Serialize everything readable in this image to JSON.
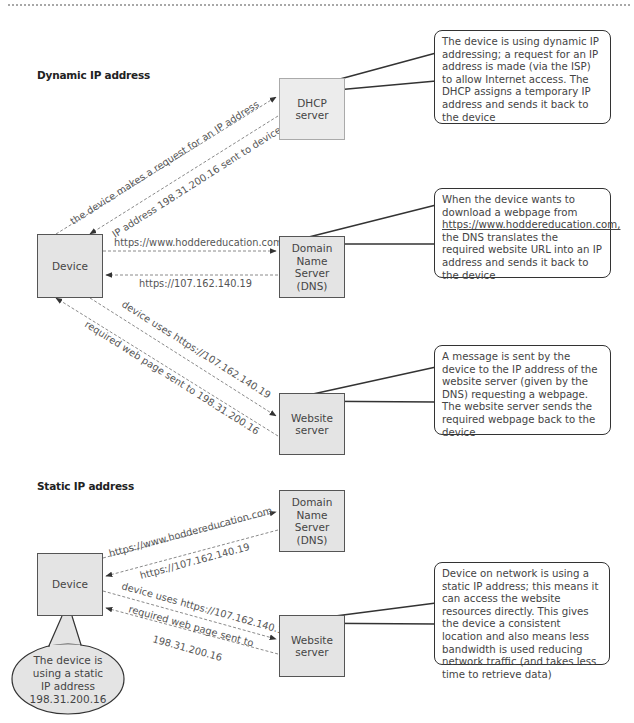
{
  "dynamic": {
    "title": "Dynamic IP address",
    "nodes": {
      "device": "Device",
      "dhcp": "DHCP\nserver",
      "dns": "Domain\nName\nServer\n(DNS)",
      "website": "Website\nserver"
    },
    "arrows": {
      "request_ip": "the device makes a request for an IP address",
      "ip_sent": "IP address 198.31.200.16 sent to device",
      "url_to_dns": "https://www.hoddereducation.com",
      "ip_from_dns": "https://107.162.140.19",
      "uses_ip": "device uses https://107.162.140.19",
      "page_sent": "required web page sent to 198.31.200.16"
    },
    "callouts": {
      "dhcp": "The device is using dynamic IP addressing; a request for an IP address is made (via the ISP) to allow Internet access. The DHCP assigns a temporary IP address and sends it back to the device",
      "dns_before": "When the device wants to download a webpage from",
      "dns_link": "https://www.hoddereducation.com,",
      "dns_after": "the DNS translates the required website URL into an IP address and sends it back to the device",
      "website": "A message is sent by the device to the IP address of the website server (given by the DNS) requesting a webpage. The website server sends the required webpage back to the device"
    }
  },
  "static": {
    "title": "Static IP address",
    "nodes": {
      "device": "Device",
      "dns": "Domain\nName\nServer\n(DNS)",
      "website": "Website\nserver"
    },
    "arrows": {
      "url_to_dns": "https://www.hoddereducation.com",
      "ip_from_dns": "https://107.162.140.19",
      "uses_ip": "device uses https://107.162.140.19",
      "page_sent_1": "required web page sent to",
      "page_sent_2": "198.31.200.16"
    },
    "bubble": "The device is\nusing a static\nIP address\n198.31.200.16",
    "callouts": {
      "website": "Device on network is using a static IP address; this means it can access the website resources directly. This gives the device a consistent location and also means less bandwidth is used reducing network traffic (and takes less time to retrieve data)"
    }
  },
  "colors": {
    "node_fill": "#e4e4e4",
    "node_border": "#555555",
    "dashed_line": "#8a8a8a",
    "callout_border": "#333333"
  }
}
